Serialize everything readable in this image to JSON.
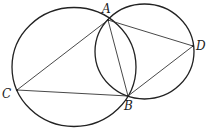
{
  "figure": {
    "stroke_color": "#222222",
    "circles": [
      {
        "name": "left-circle",
        "cx": 74,
        "cy": 67,
        "rx": 62,
        "ry": 59.5
      },
      {
        "name": "right-circle",
        "cx": 144.5,
        "cy": 51.5,
        "rx": 49.5,
        "ry": 47.5
      }
    ],
    "points": {
      "A": {
        "x": 108,
        "y": 20
      },
      "B": {
        "x": 128,
        "y": 96
      },
      "C": {
        "x": 17,
        "y": 90
      },
      "D": {
        "x": 193,
        "y": 46
      }
    },
    "labels": [
      {
        "id": "A",
        "text": "A",
        "x": 102,
        "y": 13
      },
      {
        "id": "B",
        "text": "B",
        "x": 124,
        "y": 110
      },
      {
        "id": "C",
        "text": "C",
        "x": 2,
        "y": 98
      },
      {
        "id": "D",
        "text": "D",
        "x": 196,
        "y": 50
      }
    ],
    "segments": [
      {
        "from": "C",
        "to": "A"
      },
      {
        "from": "C",
        "to": "B"
      },
      {
        "from": "A",
        "to": "B"
      },
      {
        "from": "A",
        "to": "D"
      },
      {
        "from": "B",
        "to": "D"
      }
    ]
  }
}
